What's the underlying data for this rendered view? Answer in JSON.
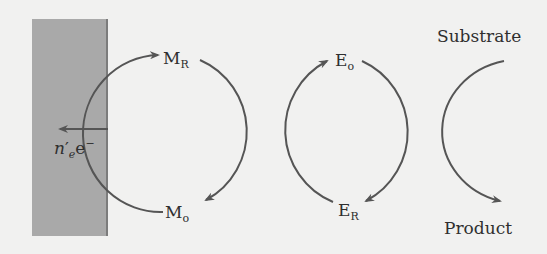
{
  "diagram": {
    "electrode": {
      "label_n": "n",
      "label_prime": "′",
      "label_sub": "e",
      "label_e": "e",
      "label_charge": "−",
      "fill": "#a9a9a9"
    },
    "mediator": {
      "reduced": {
        "base": "M",
        "sub": "R"
      },
      "oxidized": {
        "base": "M",
        "sub": "o"
      }
    },
    "enzyme": {
      "oxidized": {
        "base": "E",
        "sub": "o"
      },
      "reduced": {
        "base": "E",
        "sub": "R"
      }
    },
    "substrate_label": "Substrate",
    "product_label": "Product",
    "line_color": "#555555"
  }
}
